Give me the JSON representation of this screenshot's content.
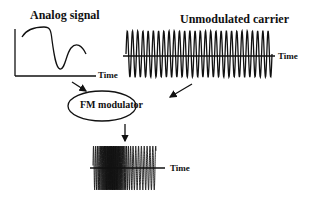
{
  "analog": {
    "title": "Analog signal",
    "axis_label": "Time"
  },
  "carrier": {
    "title": "Unmodulated carrier",
    "axis_label": "Time",
    "cycles": 28
  },
  "modulator": {
    "label": "FM modulator"
  },
  "output": {
    "axis_label": "Time"
  },
  "colors": {
    "stroke": "#111111",
    "background": "#ffffff"
  }
}
